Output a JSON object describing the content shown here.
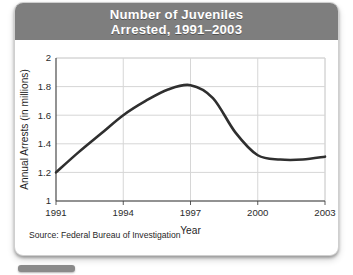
{
  "header": {
    "title_line1": "Number of Juveniles",
    "title_line2": "Arrested, 1991–2003",
    "band_color": "#7e7e7e",
    "text_color": "#ffffff"
  },
  "source": {
    "text": "Source: Federal Bureau of Investigation"
  },
  "chart_data": {
    "type": "line",
    "xlabel": "Year",
    "ylabel": "Annual Arrests (in millions)",
    "xlim": [
      1991,
      2003
    ],
    "ylim": [
      1,
      2
    ],
    "grid": true,
    "legend": "none",
    "line_color": "#2f2f2f",
    "x_tick_labels": [
      "1991",
      "1994",
      "1997",
      "2000",
      "2003"
    ],
    "x_ticks": [
      1991,
      1994,
      1997,
      2000,
      2003
    ],
    "y_tick_labels": [
      "1",
      "1.2",
      "1.4",
      "1.6",
      "1.8",
      "2"
    ],
    "y_ticks": [
      1,
      1.2,
      1.4,
      1.6,
      1.8,
      2
    ],
    "x": [
      1991,
      1992,
      1993,
      1994,
      1995,
      1996,
      1997,
      1998,
      1999,
      2000,
      2001,
      2002,
      2003
    ],
    "values": [
      1.2,
      1.34,
      1.47,
      1.6,
      1.7,
      1.78,
      1.81,
      1.72,
      1.48,
      1.32,
      1.29,
      1.29,
      1.31
    ],
    "series": [
      {
        "name": "Annual Arrests",
        "values": [
          1.2,
          1.34,
          1.47,
          1.6,
          1.7,
          1.78,
          1.81,
          1.72,
          1.48,
          1.32,
          1.29,
          1.29,
          1.31
        ]
      }
    ]
  }
}
